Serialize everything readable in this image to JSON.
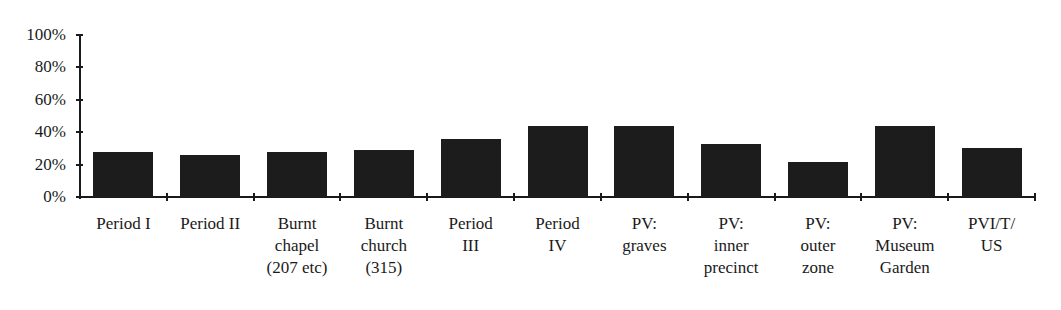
{
  "chart_data": {
    "type": "bar",
    "title": "",
    "xlabel": "",
    "ylabel": "",
    "ylim": [
      0,
      100
    ],
    "yticks": [
      "0%",
      "20%",
      "40%",
      "60%",
      "80%",
      "100%"
    ],
    "grid": false,
    "legend": null,
    "categories": [
      "Period I",
      "Period II",
      "Burnt chapel (207 etc)",
      "Burnt church (315)",
      "Period III",
      "Period IV",
      "PV: graves",
      "PV: inner precinct",
      "PV: outer zone",
      "PV: Museum Garden",
      "PVI/T/US"
    ],
    "category_label_lines": [
      "Period I",
      "Period II",
      "Burnt\nchapel\n(207 etc)",
      "Burnt\nchurch\n(315)",
      "Period\nIII",
      "Period\nIV",
      "PV:\ngraves",
      "PV:\ninner\nprecinct",
      "PV:\nouter\nzone",
      "PV:\nMuseum\nGarden",
      "PVI/T/\nUS"
    ],
    "values": [
      27.6,
      26,
      27.6,
      29,
      35.5,
      44,
      44,
      33,
      21.5,
      44,
      30.5
    ],
    "bar_color": "#1c1c1c"
  }
}
